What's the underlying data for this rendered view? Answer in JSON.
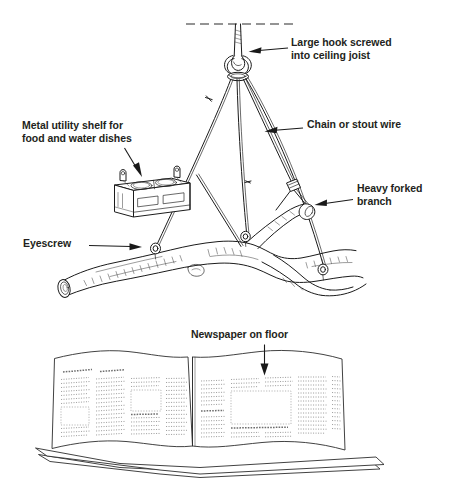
{
  "figure": {
    "background_color": "#ffffff",
    "ink_color": "#1b1b1b",
    "text_color": "#231f20",
    "style": "black-and-white pen-and-ink line drawing"
  },
  "labels": {
    "hook": "Large hook screwed\ninto ceiling joist",
    "chain": "Chain or stout wire",
    "shelf": "Metal utility shelf for\nfood and water dishes",
    "branch": "Heavy forked\nbranch",
    "eyescrew": "Eyescrew",
    "newspaper": "Newspaper on floor"
  },
  "parts": {
    "ceiling": "dashed ceiling line",
    "hook": "large screw hook",
    "wires": "four suspension wires",
    "shelf": "metal utility shelf with two dish openings",
    "branch": "heavy forked tree branch perch",
    "eyescrews": "eyescrews set into branch",
    "newspaper": "open newspaper spread on floor"
  }
}
